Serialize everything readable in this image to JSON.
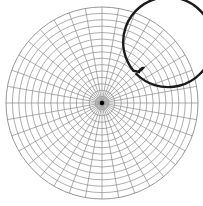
{
  "diagram": {
    "type": "polar-grid",
    "center": [
      102,
      103
    ],
    "outer_radius": 96,
    "ring_count": 15,
    "meridian_count": 36,
    "highlight_circle_radius": 45,
    "colors": {
      "background": "#ffffff",
      "grid": "#8a8a8a",
      "highlight": "#1a1a1a",
      "center_dot": "#000000"
    }
  }
}
